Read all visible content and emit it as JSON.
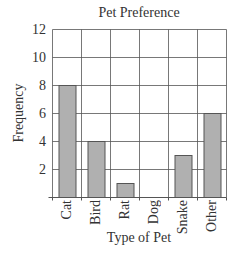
{
  "chart_data": {
    "type": "bar",
    "title": "Pet Preference",
    "xlabel": "Type of Pet",
    "ylabel": "Frequency",
    "categories": [
      "Cat",
      "Bird",
      "Rat",
      "Dog",
      "Snake",
      "Other"
    ],
    "values": [
      8,
      4,
      1,
      0,
      3,
      6
    ],
    "ylim": [
      0,
      12
    ],
    "yticks": [
      2,
      4,
      6,
      8,
      10,
      12
    ],
    "grid": true,
    "legend": null,
    "bar_color": "#b0b0b0",
    "bar_edge_color": "#555555",
    "grid_color": "#555555"
  }
}
